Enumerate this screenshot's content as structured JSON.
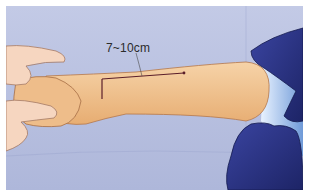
{
  "illustration": {
    "subject": "forearm incision marking",
    "annotation_label": "7~10cm",
    "colors": {
      "drape": "#b9c1e0",
      "skin": "#f2c593",
      "glove": "#27307a",
      "incision_line": "#5a1e2a",
      "inner_drape": "#8fb4e6"
    }
  }
}
